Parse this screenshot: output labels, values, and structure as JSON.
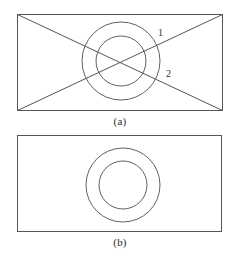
{
  "figure": {
    "background_color": "#ffffff",
    "stroke_color": "#555555",
    "text_color": "#2b2b2b",
    "panels": [
      {
        "id": "a",
        "caption": "(a)",
        "rect": {
          "x": 17,
          "y": 14,
          "width": 206,
          "height": 97
        },
        "diagonals": true,
        "circles": [
          {
            "name": "outer-circle",
            "cx": 121,
            "cy": 61,
            "r": 39
          },
          {
            "name": "inner-circle",
            "cx": 121,
            "cy": 61,
            "r": 25
          }
        ],
        "leader_lines": [
          {
            "label": "1",
            "x1": 132,
            "y1": 73,
            "x2": 182,
            "y2": 24
          },
          {
            "label": "2",
            "x1": 132,
            "y1": 50,
            "x2": 190,
            "y2": 90
          }
        ],
        "labels": [
          {
            "name": "leader-label-1",
            "text": "1"
          },
          {
            "name": "leader-label-2",
            "text": "2"
          }
        ]
      },
      {
        "id": "b",
        "caption": "(b)",
        "rect": {
          "x": 17,
          "y": 135,
          "width": 205,
          "height": 97
        },
        "diagonals": false,
        "circles": [
          {
            "name": "outer-circle",
            "cx": 123,
            "cy": 185,
            "r": 37
          },
          {
            "name": "inner-circle",
            "cx": 123,
            "cy": 185,
            "r": 24
          }
        ],
        "leader_lines": [],
        "labels": []
      }
    ]
  }
}
